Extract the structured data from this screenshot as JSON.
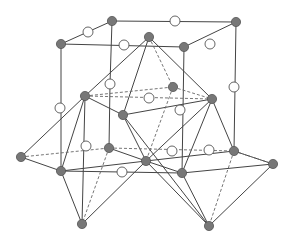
{
  "diagram": {
    "title": "",
    "colors": {
      "filled_atom": "#777777",
      "open_atom": "#ffffff",
      "edge": "#444444"
    },
    "nodes": {
      "A": {
        "type": "filled"
      },
      "B": {
        "type": "filled"
      },
      "C": {
        "type": "filled"
      },
      "D": {
        "type": "filled"
      },
      "E": {
        "type": "filled"
      },
      "F": {
        "type": "filled"
      },
      "G": {
        "type": "filled"
      },
      "H": {
        "type": "filled"
      },
      "I": {
        "type": "filled"
      },
      "J": {
        "type": "filled"
      },
      "K": {
        "type": "filled"
      },
      "L": {
        "type": "filled"
      },
      "M": {
        "type": "filled"
      },
      "N": {
        "type": "filled"
      },
      "O": {
        "type": "filled"
      },
      "P": {
        "type": "filled"
      },
      "Q": {
        "type": "filled"
      },
      "R": {
        "type": "filled"
      },
      "w1": {
        "type": "open"
      },
      "w2": {
        "type": "open"
      },
      "w3": {
        "type": "open"
      },
      "w4": {
        "type": "open"
      },
      "w5": {
        "type": "open"
      },
      "w6": {
        "type": "open"
      },
      "w7": {
        "type": "open"
      },
      "w8": {
        "type": "open"
      },
      "w9": {
        "type": "open"
      },
      "w10": {
        "type": "open"
      },
      "w11": {
        "type": "open"
      },
      "w12": {
        "type": "open"
      },
      "w13": {
        "type": "open"
      }
    },
    "edges_solid": [
      [
        "A",
        "B"
      ],
      [
        "A",
        "C"
      ],
      [
        "C",
        "E"
      ],
      [
        "B",
        "E"
      ],
      [
        "A",
        "w5"
      ],
      [
        "C",
        "N"
      ],
      [
        "E",
        "O"
      ],
      [
        "B",
        "M"
      ],
      [
        "D",
        "F"
      ],
      [
        "D",
        "H"
      ],
      [
        "D",
        "I"
      ],
      [
        "F",
        "I"
      ],
      [
        "I",
        "H"
      ],
      [
        "F",
        "J"
      ],
      [
        "F",
        "N"
      ],
      [
        "F",
        "L"
      ],
      [
        "J",
        "N"
      ],
      [
        "N",
        "Q"
      ],
      [
        "J",
        "Q"
      ],
      [
        "N",
        "L"
      ],
      [
        "N",
        "O"
      ],
      [
        "K",
        "L"
      ],
      [
        "K",
        "N"
      ],
      [
        "L",
        "O"
      ],
      [
        "L",
        "M"
      ],
      [
        "L",
        "Q"
      ],
      [
        "L",
        "R"
      ],
      [
        "H",
        "M"
      ],
      [
        "H",
        "O"
      ],
      [
        "H",
        "L"
      ],
      [
        "M",
        "O"
      ],
      [
        "O",
        "P"
      ],
      [
        "M",
        "P"
      ],
      [
        "P",
        "R"
      ],
      [
        "O",
        "R"
      ],
      [
        "I",
        "L"
      ],
      [
        "I",
        "R"
      ],
      [
        "F",
        "Q"
      ]
    ],
    "edges_dashed": [
      [
        "D",
        "G"
      ],
      [
        "F",
        "G"
      ],
      [
        "G",
        "H"
      ],
      [
        "G",
        "L"
      ],
      [
        "F",
        "H"
      ],
      [
        "J",
        "K"
      ],
      [
        "K",
        "M"
      ],
      [
        "L",
        "Q"
      ],
      [
        "M",
        "P"
      ],
      [
        "K",
        "Q"
      ],
      [
        "M",
        "R"
      ]
    ]
  }
}
